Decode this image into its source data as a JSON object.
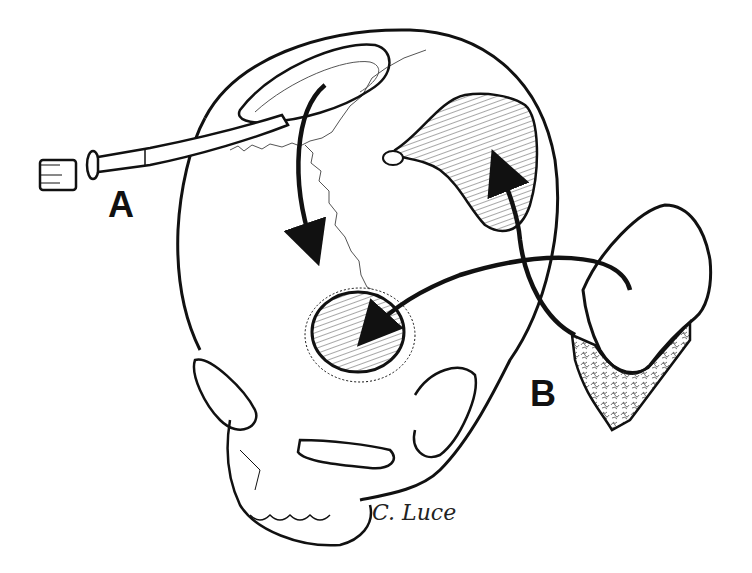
{
  "figure": {
    "type": "medical-illustration",
    "labels": [
      {
        "id": "A",
        "text": "A",
        "describes": "osteotome harvesting outer table bone graft"
      },
      {
        "id": "B",
        "text": "B",
        "describes": "full-thickness calvarial bone graft segment"
      }
    ],
    "signature": "C. Luce",
    "colors": {
      "ink": "#111111",
      "background": "#ffffff"
    }
  }
}
